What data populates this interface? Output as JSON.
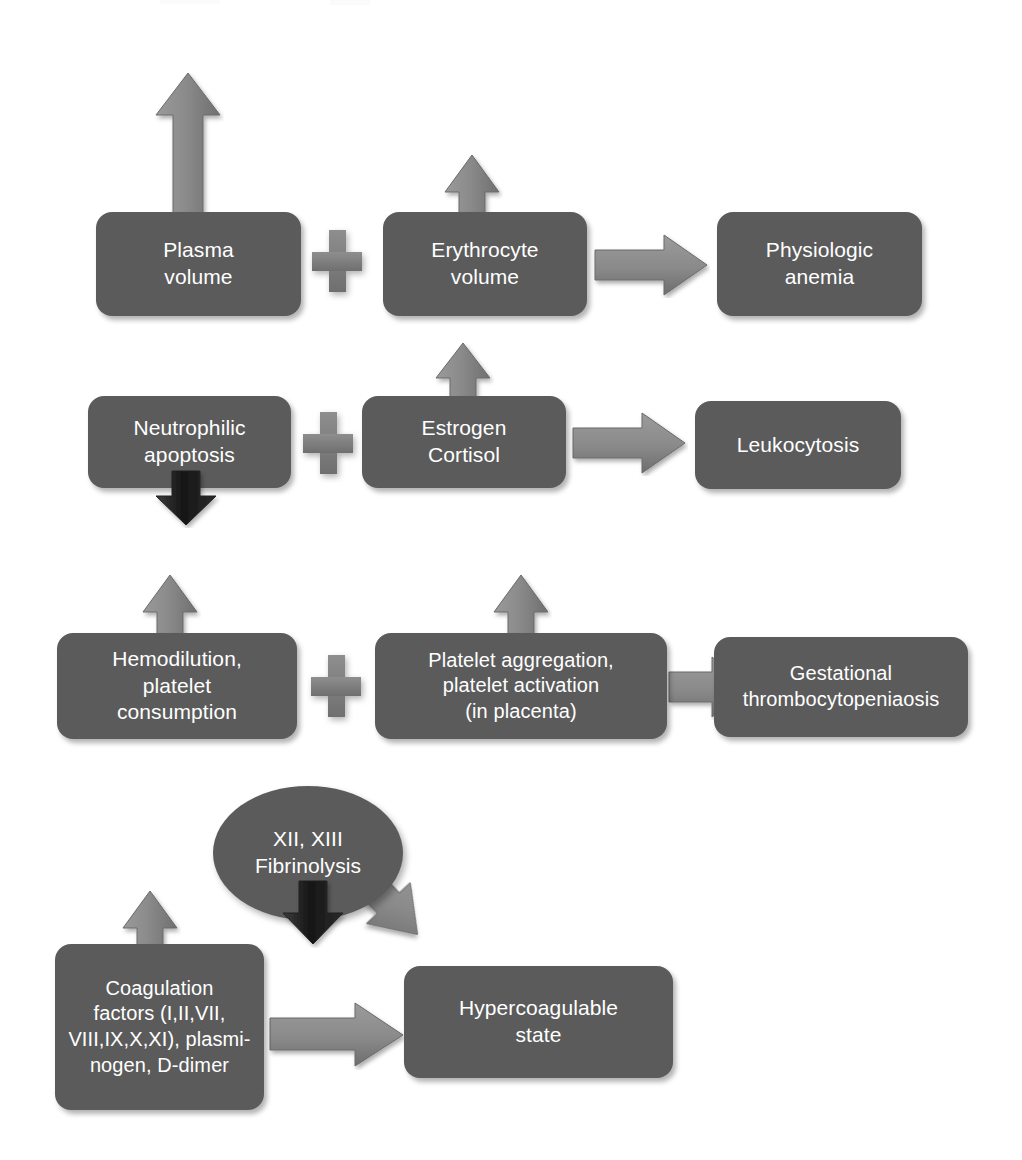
{
  "figure": {
    "background_color": "#ffffff",
    "node_fill_color": "#5b5b5b",
    "node_text_color": "#ffffff",
    "arrow_color_light": "#8d8d8d",
    "arrow_color_dark": "#1d1d1d",
    "plus_color": "#7b7b7b"
  },
  "rows": [
    {
      "id": "row-anemia",
      "left_node": {
        "lines": [
          "Plasma",
          "volume"
        ],
        "trend_arrow": "up",
        "trend_arrow_color": "light"
      },
      "operator": "plus",
      "middle_node": {
        "lines": [
          "Erythrocyte",
          "volume"
        ],
        "trend_arrow": "up",
        "trend_arrow_color": "light"
      },
      "connector": "right-arrow",
      "result_node": {
        "lines": [
          "Physiologic",
          "anemia"
        ]
      }
    },
    {
      "id": "row-leukocytosis",
      "left_node": {
        "lines": [
          "Neutrophilic",
          "apoptosis"
        ],
        "trend_arrow": "down",
        "trend_arrow_color": "dark"
      },
      "operator": "plus",
      "middle_node": {
        "lines": [
          "Estrogen",
          "Cortisol"
        ],
        "trend_arrow": "up",
        "trend_arrow_color": "light"
      },
      "connector": "right-arrow",
      "result_node": {
        "lines": [
          "Leukocytosis"
        ]
      }
    },
    {
      "id": "row-thrombocytopenia",
      "left_node": {
        "lines": [
          "Hemodilution,",
          "platelet",
          "consumption"
        ],
        "trend_arrow": "up",
        "trend_arrow_color": "light"
      },
      "operator": "plus",
      "middle_node": {
        "lines": [
          "Platelet aggregation,",
          "platelet activation",
          "(in placenta)"
        ],
        "trend_arrow": "up",
        "trend_arrow_color": "light"
      },
      "connector": "right-arrow",
      "result_node": {
        "lines": [
          "Gestational",
          "thrombocytopeniaosis"
        ]
      }
    },
    {
      "id": "row-hypercoagulable",
      "left_node": {
        "lines": [
          "Coagulation",
          "factors (I,II,VII,",
          "VIII,IX,X,XI), plasmi-",
          "nogen, D-dimer"
        ],
        "trend_arrow": "up",
        "trend_arrow_color": "light"
      },
      "ellipse_node": {
        "lines": [
          "XII, XIII",
          "Fibrinolysis"
        ],
        "trend_arrow": "down",
        "trend_arrow_color": "dark"
      },
      "connector": "right-arrow",
      "diagonal_connector": "diagonal-down-right-arrow",
      "result_node": {
        "lines": [
          "Hypercoagulable",
          "state"
        ]
      }
    }
  ]
}
